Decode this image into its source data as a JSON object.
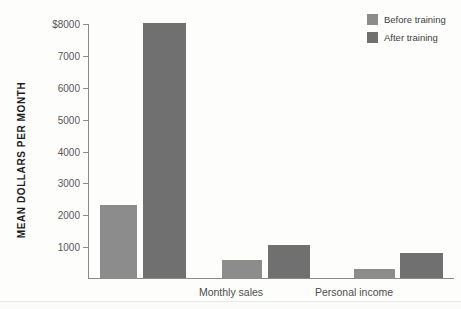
{
  "chart_data": {
    "type": "bar",
    "title": "",
    "xlabel": "",
    "ylabel": "MEAN DOLLARS PER MONTH",
    "ylim": [
      0,
      8000
    ],
    "yticks": [
      1000,
      2000,
      3000,
      4000,
      5000,
      6000,
      7000,
      8000
    ],
    "ytick_labels": [
      "1000",
      "2000",
      "3000",
      "4000",
      "5000",
      "6000",
      "7000",
      "$8000"
    ],
    "grid": false,
    "legend_position": "top-right",
    "categories": [
      "Monthly sales",
      "Personal income",
      "Profits"
    ],
    "series": [
      {
        "name": "Before training",
        "color": "#8c8c8c",
        "values": [
          2300,
          570,
          290
        ]
      },
      {
        "name": "After training",
        "color": "#707070",
        "values": [
          8000,
          1040,
          800
        ]
      }
    ]
  }
}
